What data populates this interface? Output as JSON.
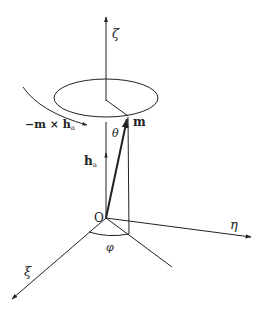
{
  "diagram": {
    "axes": {
      "zeta": {
        "label": "ζ"
      },
      "eta": {
        "label": "η"
      },
      "xi": {
        "label": "ξ"
      }
    },
    "origin": {
      "label": "O"
    },
    "vectors": {
      "m": {
        "label": "m"
      },
      "h_a": {
        "label_main": "h",
        "label_sub": "a"
      }
    },
    "angles": {
      "theta": {
        "label": "θ"
      },
      "phi": {
        "label": "φ"
      }
    },
    "torque": {
      "label_prefix": "−m × h",
      "label_sub": "a"
    },
    "colors": {
      "line": "#222222",
      "background": "#ffffff"
    }
  }
}
